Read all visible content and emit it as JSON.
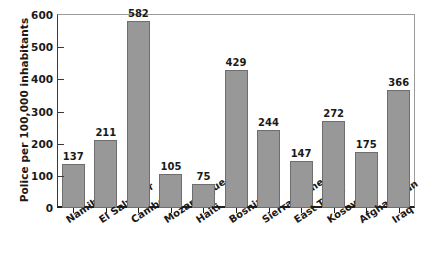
{
  "chart_data": {
    "type": "bar",
    "title": "",
    "xlabel": "",
    "ylabel": "Police per 100,000 inhabitants",
    "ylim": [
      0,
      600
    ],
    "yticks": [
      0,
      100,
      200,
      300,
      400,
      500,
      600
    ],
    "ytick_labels": [
      "0",
      "100",
      "200",
      "300",
      "400",
      "500",
      "600"
    ],
    "grid": false,
    "legend": null,
    "bar_color": "#989898",
    "bar_edge_color": "#6e6e6e",
    "categories": [
      "Namibia",
      "El Salvador",
      "Cambodia",
      "Mozambique",
      "Haiti",
      "Bosnia",
      "Sierra Leone",
      "East Timor",
      "Kosovo",
      "Afghanistan",
      "Iraq"
    ],
    "values": [
      137,
      211,
      582,
      105,
      75,
      429,
      244,
      147,
      272,
      175,
      366
    ],
    "value_labels": [
      "137",
      "211",
      "582",
      "105",
      "75",
      "429",
      "244",
      "147",
      "272",
      "175",
      "366"
    ]
  }
}
